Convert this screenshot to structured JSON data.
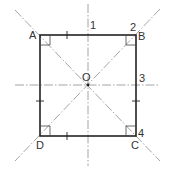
{
  "diagram": {
    "colors": {
      "outline": "#222222",
      "construction": "#9a9a9a",
      "text": "#333333"
    },
    "vertices": {
      "A": {
        "label": "A",
        "x": 40,
        "y": 35
      },
      "B": {
        "label": "B",
        "x": 136,
        "y": 35
      },
      "C": {
        "label": "C",
        "x": 136,
        "y": 136
      },
      "D": {
        "label": "D",
        "x": 40,
        "y": 136
      }
    },
    "center": {
      "label": "O",
      "x": 88,
      "y": 85
    },
    "markers": {
      "m1": "1",
      "m2": "2",
      "m3": "3",
      "m4": "4"
    }
  }
}
